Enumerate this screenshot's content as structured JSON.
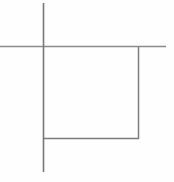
{
  "canvas": {
    "width": 174,
    "height": 182,
    "background_color": "#fefefe",
    "title": "Square with crossing axis lines"
  },
  "style": {
    "stroke_color": "#77777a",
    "stroke_color_light": "#9a9a9e",
    "stroke_width": 1.5
  },
  "figure": {
    "type": "line-drawing",
    "shapes": [
      {
        "name": "vertical-line",
        "kind": "line",
        "x1": 43.5,
        "y1": 3,
        "x2": 43.5,
        "y2": 172,
        "color": "#77777a",
        "width": 1.6
      },
      {
        "name": "horizontal-line",
        "kind": "line",
        "x1": 0,
        "y1": 46.5,
        "x2": 166,
        "y2": 46.5,
        "color": "#8a8a8d",
        "width": 1.4
      },
      {
        "name": "square-right-edge",
        "kind": "line",
        "x1": 138.5,
        "y1": 47,
        "x2": 138.5,
        "y2": 139,
        "color": "#7c7c80",
        "width": 1.5
      },
      {
        "name": "square-bottom-edge",
        "kind": "line",
        "x1": 43,
        "y1": 138.5,
        "x2": 139,
        "y2": 138.5,
        "color": "#7c7c80",
        "width": 1.5
      }
    ],
    "intersections": [
      {
        "name": "cross-point",
        "x": 43.5,
        "y": 46.5
      },
      {
        "name": "top-right-corner",
        "x": 138.5,
        "y": 46.5
      },
      {
        "name": "bottom-right-corner",
        "x": 138.5,
        "y": 138.5
      },
      {
        "name": "bottom-left-corner",
        "x": 43.5,
        "y": 138.5
      }
    ],
    "overshoots": [
      {
        "name": "vertical-top-overshoot",
        "length_px": 44
      },
      {
        "name": "vertical-bottom-overshoot",
        "length_px": 33
      },
      {
        "name": "horizontal-left-overshoot",
        "length_px": 43
      },
      {
        "name": "horizontal-right-overshoot",
        "length_px": 27
      }
    ],
    "square": {
      "left": 43.5,
      "top": 46.5,
      "right": 138.5,
      "bottom": 138.5,
      "width_px": 95,
      "height_px": 92
    }
  }
}
